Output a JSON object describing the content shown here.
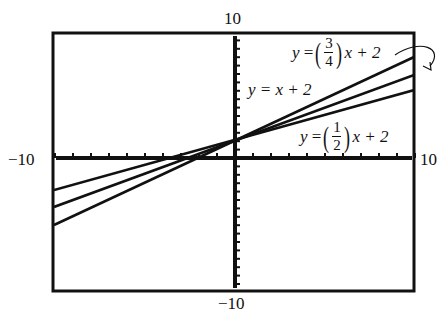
{
  "chart_data": {
    "type": "line",
    "title": "",
    "xlabel": "",
    "ylabel": "",
    "xlim": [
      -10,
      10
    ],
    "ylim": [
      -10,
      10
    ],
    "tick_labels": {
      "x_min": "−10",
      "x_max": "10",
      "y_min": "−10",
      "y_max": "10"
    },
    "grid": false,
    "series": [
      {
        "name": "y = (3/4)x + 2",
        "slope": 0.75,
        "intercept": 2,
        "x": [
          -10,
          10
        ],
        "y": [
          -5.5,
          9.5
        ]
      },
      {
        "name": "y = x + 2",
        "slope": 1,
        "intercept": 2,
        "x": [
          -10,
          10
        ],
        "y": [
          -8,
          12
        ]
      },
      {
        "name": "y = (1/2)x + 2",
        "slope": 0.5,
        "intercept": 2,
        "x": [
          -10,
          10
        ],
        "y": [
          -3,
          7
        ]
      }
    ],
    "annotations": [
      "curved arrow from y=(3/4)x+2 label pointing to its line at right edge"
    ]
  },
  "labels": {
    "x_min": "−10",
    "x_max": "10",
    "y_max": "10",
    "y_min": "−10",
    "eq1": {
      "y": "y",
      "eqs": "=",
      "num": "3",
      "den": "4",
      "rest": "x + 2"
    },
    "eq2": {
      "text_y": "y",
      "text_rest": "= x + 2"
    },
    "eq3": {
      "y": "y",
      "eqs": "=",
      "num": "1",
      "den": "2",
      "rest": "x + 2"
    }
  }
}
